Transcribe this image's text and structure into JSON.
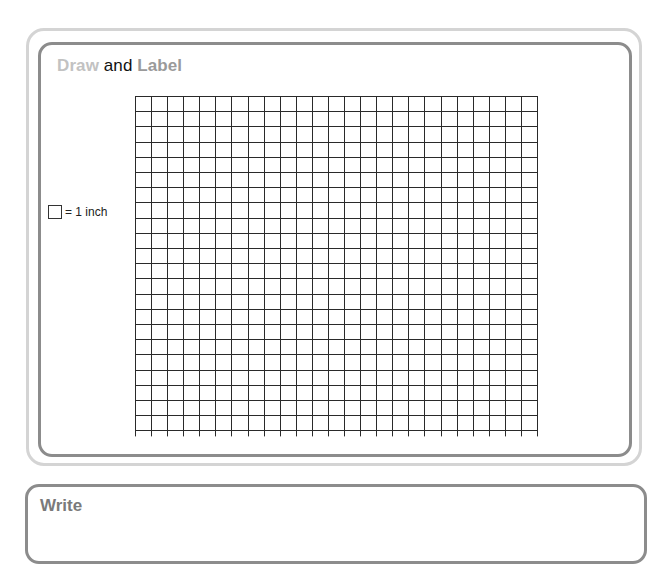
{
  "draw_section": {
    "title_part1": "Draw",
    "title_part2": " and ",
    "title_part3": "Label",
    "legend": {
      "icon": "square-unit-icon",
      "text": "= 1 inch"
    },
    "grid": {
      "columns": 25,
      "rows": 22,
      "cell_width": 16.08,
      "cell_height": 15.2,
      "line_color": "#2a2a2a"
    }
  },
  "write_section": {
    "title": "Write"
  },
  "colors": {
    "outer_border": "#d4d4d4",
    "inner_border": "#8c8c8c",
    "draw_word": "#c2c2c2",
    "label_word": "#9a9a9a",
    "write_word": "#7a7a7a"
  }
}
